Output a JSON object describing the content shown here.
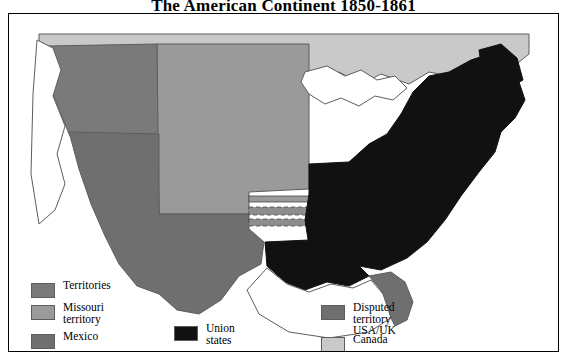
{
  "title": "The American Continent 1850-1861",
  "map": {
    "alt": "Map of the American continent showing territories, Missouri territory, Mexico, Union states, disputed territory USA/UK and Canada, 1850-1861",
    "colors": {
      "territories": "#7a7a7a",
      "missouri_territory": "#9a9a9a",
      "mexico": "#6f6f6f",
      "union_states": "#111111",
      "disputed_territory": "#6f6f6f",
      "canada": "#c9c9c9",
      "water": "#ffffff",
      "outline": "#4a4a4a",
      "frame": "#000000",
      "background": "#ffffff"
    }
  },
  "legend": {
    "columns": [
      {
        "items": [
          {
            "label": "Territories",
            "color": "#7a7a7a",
            "swatch_name": "legend-swatch-territories"
          },
          {
            "label": "Missouri\nterritory",
            "color": "#9a9a9a",
            "swatch_name": "legend-swatch-missouri-territory"
          },
          {
            "label": "Mexico",
            "color": "#6f6f6f",
            "swatch_name": "legend-swatch-mexico"
          }
        ]
      },
      {
        "items": [
          {
            "label": "Union\nstates",
            "color": "#111111",
            "swatch_name": "legend-swatch-union-states"
          }
        ]
      },
      {
        "items": [
          {
            "label": "Disputed\nterritory USA/UK",
            "color": "#6f6f6f",
            "swatch_name": "legend-swatch-disputed-territory"
          },
          {
            "label": "Canada",
            "color": "#c9c9c9",
            "swatch_name": "legend-swatch-canada"
          }
        ]
      }
    ]
  }
}
